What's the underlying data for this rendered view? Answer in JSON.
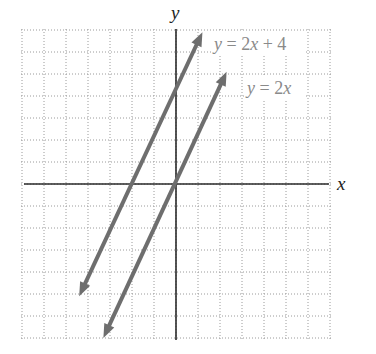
{
  "chart_data": {
    "type": "line",
    "title": "",
    "xlabel": "x",
    "ylabel": "y",
    "xlim": [
      -7,
      7
    ],
    "ylim": [
      -7,
      7
    ],
    "grid": true,
    "grid_style": "dotted",
    "grid_step": 1,
    "legend_position": "inline-labels-top-right",
    "series": [
      {
        "name": "y = 2x + 4",
        "equation": "y = 2x + 4",
        "slope": 2,
        "intercept": 4,
        "color": "#6e6e6e",
        "arrows": "both",
        "endpoints": [
          [
            -4.4,
            -5.1
          ],
          [
            1.2,
            6.9
          ]
        ],
        "label": {
          "text": "y = 2x + 4",
          "x": 1.75,
          "y": 6.4
        }
      },
      {
        "name": "y = 2x",
        "equation": "y = 2x",
        "slope": 2,
        "intercept": 0,
        "color": "#6e6e6e",
        "arrows": "both",
        "endpoints": [
          [
            -3.3,
            -7.0
          ],
          [
            2.3,
            5.1
          ]
        ],
        "label": {
          "text": "y = 2x",
          "x": 3.25,
          "y": 4.4
        }
      }
    ]
  },
  "axes": {
    "x_label": "x",
    "y_label": "y"
  },
  "labels": {
    "line1": {
      "y": "y",
      "eq": " = 2",
      "x": "x",
      "rest": " + 4"
    },
    "line2": {
      "y": "y",
      "eq": " = 2",
      "x": "x",
      "rest": ""
    }
  },
  "colors": {
    "lines": "#6e6e6e",
    "axes": "#2a2a2a",
    "grid": "#9a9a9a",
    "label_text": "#8a8a8a"
  }
}
